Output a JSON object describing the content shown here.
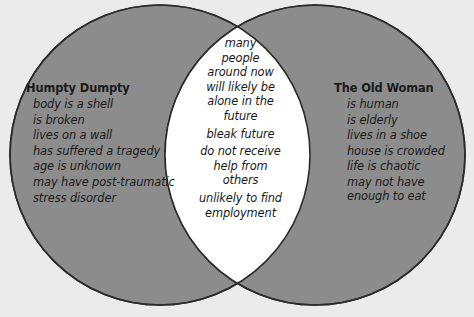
{
  "diagram": {
    "type": "venn",
    "title": "",
    "colors": {
      "background": "#ebebeb",
      "circle_fill": "#8c8c8c",
      "circle_stroke": "#2b2b2b",
      "overlap_fill": "#ffffff",
      "text": "#1a1a1a"
    },
    "left": {
      "heading": "Humpty Dumpty",
      "items": [
        "body is a shell",
        "is broken",
        "lives on a wall",
        "has suffered a tragedy",
        "age is unknown",
        "may have post-traumatic",
        " stress disorder"
      ]
    },
    "center": {
      "heading": "",
      "items": [
        "many",
        "people",
        "around now",
        "will likely be",
        "alone in the",
        "future",
        "bleak future",
        "do not receive",
        "help from",
        "others",
        "unlikely to find",
        "employment"
      ]
    },
    "right": {
      "heading": "The Old Woman",
      "items": [
        "is human",
        "is elderly",
        "lives in a shoe",
        "house is crowded",
        "life is chaotic",
        "may not have",
        "enough to eat"
      ]
    }
  }
}
